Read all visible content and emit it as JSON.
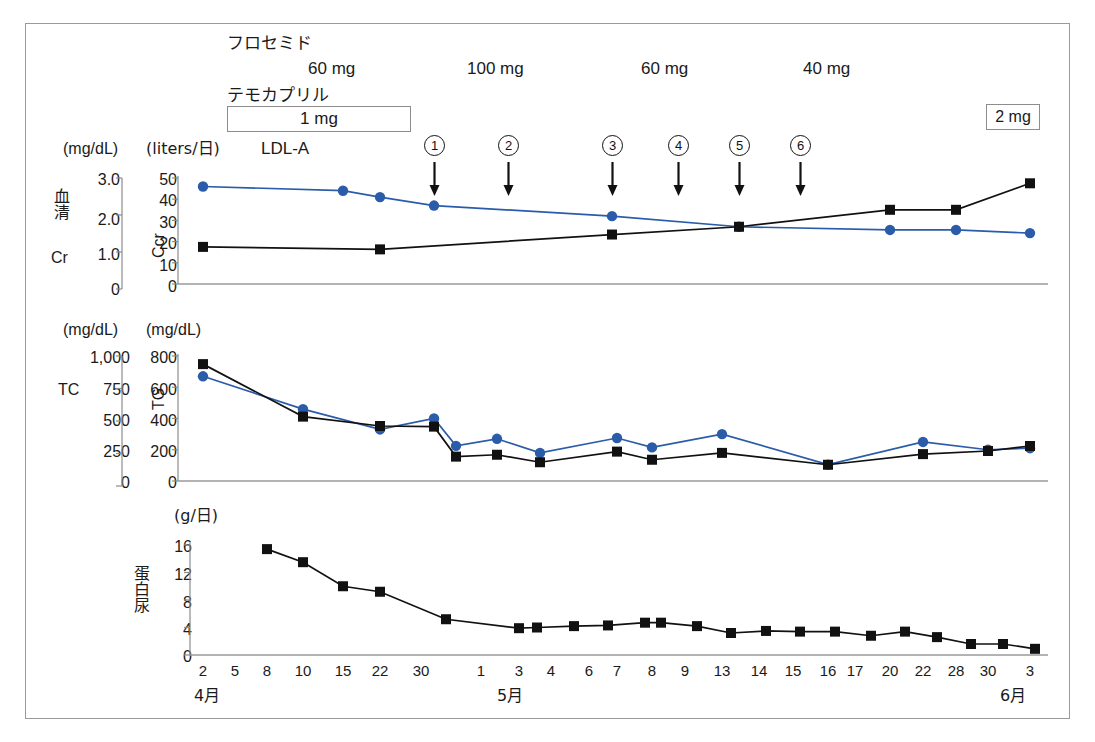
{
  "figure": {
    "title_absent": true,
    "border_color": "#9a9a9a",
    "series_colors": {
      "blue": "#2a5caa",
      "black": "#111111",
      "axis": "#8c8c8c"
    }
  },
  "treatment_header": {
    "drug1_name": "フロセミド",
    "drug1_doses": [
      {
        "label": "60 mg",
        "x": 310
      },
      {
        "label": "100 mg",
        "x": 470
      },
      {
        "label": "60 mg",
        "x": 645
      },
      {
        "label": "40 mg",
        "x": 805
      }
    ],
    "drug2_name": "テモカプリル",
    "drug2_dose_box": "1 mg",
    "drug2_dose_box2": "2 mg",
    "apheresis_label": "LDL-A",
    "session_markers": [
      {
        "label": "1",
        "x": 434
      },
      {
        "label": "2",
        "x": 508
      },
      {
        "label": "3",
        "x": 612
      },
      {
        "label": "4",
        "x": 678
      },
      {
        "label": "5",
        "x": 739
      },
      {
        "label": "6",
        "x": 800
      }
    ]
  },
  "panel1": {
    "left_axis": {
      "name": "血清Cr",
      "name_chars": [
        "血",
        "清",
        "Cr"
      ],
      "unit": "(mg/dL)",
      "ticks": [
        "3.0",
        "2.0",
        "1.0",
        "0"
      ],
      "min": 0,
      "max": 3.0
    },
    "right_axis": {
      "name": "Ccr",
      "unit": "(liters/日)",
      "ticks": [
        "50",
        "40",
        "30",
        "20",
        "10",
        "0"
      ],
      "min": 0,
      "max": 50
    }
  },
  "panel2": {
    "left_axis": {
      "name": "TC",
      "unit": "(mg/dL)",
      "ticks": [
        "1,000",
        "750",
        "500",
        "250",
        "0"
      ],
      "min": 0,
      "max": 1000
    },
    "right_axis": {
      "name": "TG",
      "unit": "(mg/dL)",
      "ticks": [
        "800",
        "600",
        "400",
        "200",
        "0"
      ],
      "min": 0,
      "max": 800
    }
  },
  "panel3": {
    "axis": {
      "name": "蛋白尿",
      "name_chars": [
        "蛋",
        "白",
        "尿"
      ],
      "unit": "(g/日)",
      "ticks": [
        "16",
        "12",
        "8",
        "4",
        "0"
      ],
      "min": 0,
      "max": 16
    }
  },
  "xaxis": {
    "month_labels": [
      {
        "label": "4月",
        "x": 205
      },
      {
        "label": "5月",
        "x": 510
      },
      {
        "label": "6月",
        "x": 1012
      }
    ],
    "ticks": [
      {
        "day": "2",
        "x": 203
      },
      {
        "day": "5",
        "x": 235
      },
      {
        "day": "8",
        "x": 267
      },
      {
        "day": "10",
        "x": 303
      },
      {
        "day": "15",
        "x": 343
      },
      {
        "day": "22",
        "x": 380
      },
      {
        "day": "30",
        "x": 421
      },
      {
        "day": "1",
        "x": 481
      },
      {
        "day": "3",
        "x": 519
      },
      {
        "day": "4",
        "x": 551
      },
      {
        "day": "6",
        "x": 589
      },
      {
        "day": "7",
        "x": 617
      },
      {
        "day": "8",
        "x": 652
      },
      {
        "day": "9",
        "x": 685
      },
      {
        "day": "13",
        "x": 722
      },
      {
        "day": "14",
        "x": 759
      },
      {
        "day": "15",
        "x": 793
      },
      {
        "day": "16",
        "x": 828
      },
      {
        "day": "17",
        "x": 855
      },
      {
        "day": "20",
        "x": 890
      },
      {
        "day": "22",
        "x": 923
      },
      {
        "day": "28",
        "x": 956
      },
      {
        "day": "30",
        "x": 988
      },
      {
        "day": "3",
        "x": 1030
      }
    ]
  },
  "chart_data": [
    {
      "type": "line",
      "title": "血清Cr / Ccr",
      "xlabel": "",
      "ylabel": "Ccr (liters/日)",
      "y2label": "血清Cr (mg/dL)",
      "ylim": [
        0,
        50
      ],
      "y2lim": [
        0,
        3.0
      ],
      "grid": false,
      "series": [
        {
          "name": "Ccr",
          "color": "#2a5caa",
          "marker": "circle",
          "unit": "liters/日",
          "points": [
            {
              "date": "4/2",
              "x": 203,
              "value": 46
            },
            {
              "date": "4/15",
              "x": 343,
              "value": 44
            },
            {
              "date": "4/22",
              "x": 380,
              "value": 41
            },
            {
              "date": "4/30",
              "x": 434,
              "value": 37
            },
            {
              "date": "5/7",
              "x": 612,
              "value": 32
            },
            {
              "date": "5/14",
              "x": 739,
              "value": 27
            },
            {
              "date": "5/22",
              "x": 890,
              "value": 25.5
            },
            {
              "date": "5/28",
              "x": 956,
              "value": 25.5
            },
            {
              "date": "6/3",
              "x": 1030,
              "value": 24
            }
          ]
        },
        {
          "name": "血清Cr",
          "color": "#111111",
          "marker": "square",
          "unit": "mg/dL",
          "points": [
            {
              "date": "4/2",
              "x": 203,
              "value": 1.05
            },
            {
              "date": "4/22",
              "x": 380,
              "value": 0.98
            },
            {
              "date": "5/7",
              "x": 612,
              "value": 1.4
            },
            {
              "date": "5/14",
              "x": 739,
              "value": 1.62
            },
            {
              "date": "5/22",
              "x": 890,
              "value": 2.1
            },
            {
              "date": "5/28",
              "x": 956,
              "value": 2.1
            },
            {
              "date": "6/3",
              "x": 1030,
              "value": 2.85
            }
          ]
        }
      ]
    },
    {
      "type": "line",
      "title": "TC / TG",
      "xlabel": "",
      "ylabel": "TG (mg/dL)",
      "y2label": "TC (mg/dL)",
      "ylim": [
        0,
        800
      ],
      "y2lim": [
        0,
        1000
      ],
      "grid": false,
      "series": [
        {
          "name": "TG",
          "color": "#2a5caa",
          "marker": "circle",
          "unit": "mg/dL",
          "points": [
            {
              "date": "4/2",
              "x": 203,
              "value": 670
            },
            {
              "date": "4/10",
              "x": 303,
              "value": 460
            },
            {
              "date": "4/22",
              "x": 380,
              "value": 330
            },
            {
              "date": "4/30",
              "x": 434,
              "value": 400
            },
            {
              "date": "5/1",
              "x": 456,
              "value": 225
            },
            {
              "date": "5/3",
              "x": 497,
              "value": 270
            },
            {
              "date": "5/4",
              "x": 540,
              "value": 180
            },
            {
              "date": "5/7",
              "x": 617,
              "value": 275
            },
            {
              "date": "5/8",
              "x": 652,
              "value": 215
            },
            {
              "date": "5/13",
              "x": 722,
              "value": 300
            },
            {
              "date": "5/16",
              "x": 828,
              "value": 105
            },
            {
              "date": "5/22",
              "x": 923,
              "value": 250
            },
            {
              "date": "5/30",
              "x": 988,
              "value": 200
            },
            {
              "date": "6/3",
              "x": 1030,
              "value": 210
            }
          ]
        },
        {
          "name": "TC",
          "color": "#111111",
          "marker": "square",
          "unit": "mg/dL",
          "points": [
            {
              "date": "4/2",
              "x": 203,
              "value": 935
            },
            {
              "date": "4/10",
              "x": 303,
              "value": 515
            },
            {
              "date": "4/22",
              "x": 380,
              "value": 440
            },
            {
              "date": "4/30",
              "x": 434,
              "value": 435
            },
            {
              "date": "5/1",
              "x": 456,
              "value": 195
            },
            {
              "date": "5/3",
              "x": 497,
              "value": 210
            },
            {
              "date": "5/4",
              "x": 540,
              "value": 150
            },
            {
              "date": "5/7",
              "x": 617,
              "value": 235
            },
            {
              "date": "5/8",
              "x": 652,
              "value": 170
            },
            {
              "date": "5/13",
              "x": 722,
              "value": 225
            },
            {
              "date": "5/16",
              "x": 828,
              "value": 130
            },
            {
              "date": "5/22",
              "x": 923,
              "value": 215
            },
            {
              "date": "5/30",
              "x": 988,
              "value": 240
            },
            {
              "date": "6/3",
              "x": 1030,
              "value": 280
            }
          ]
        }
      ]
    },
    {
      "type": "line",
      "title": "蛋白尿",
      "xlabel": "",
      "ylabel": "蛋白尿 (g/日)",
      "ylim": [
        0,
        16
      ],
      "grid": false,
      "series": [
        {
          "name": "蛋白尿",
          "color": "#111111",
          "marker": "square",
          "unit": "g/日",
          "points": [
            {
              "date": "4/8",
              "x": 267,
              "value": 15.4
            },
            {
              "date": "4/10",
              "x": 303,
              "value": 13.5
            },
            {
              "date": "4/15",
              "x": 343,
              "value": 10.0
            },
            {
              "date": "4/22",
              "x": 380,
              "value": 9.2
            },
            {
              "date": "4/30",
              "x": 446,
              "value": 5.2
            },
            {
              "date": "5/1",
              "x": 519,
              "value": 3.9
            },
            {
              "date": "5/3",
              "x": 537,
              "value": 4.0
            },
            {
              "date": "5/4",
              "x": 574,
              "value": 4.2
            },
            {
              "date": "5/6",
              "x": 608,
              "value": 4.3
            },
            {
              "date": "5/7",
              "x": 645,
              "value": 4.7
            },
            {
              "date": "5/8",
              "x": 661,
              "value": 4.7
            },
            {
              "date": "5/9",
              "x": 697,
              "value": 4.2
            },
            {
              "date": "5/13",
              "x": 731,
              "value": 3.2
            },
            {
              "date": "5/14",
              "x": 766,
              "value": 3.5
            },
            {
              "date": "5/15",
              "x": 800,
              "value": 3.4
            },
            {
              "date": "5/16",
              "x": 835,
              "value": 3.4
            },
            {
              "date": "5/17",
              "x": 871,
              "value": 2.8
            },
            {
              "date": "5/20",
              "x": 905,
              "value": 3.4
            },
            {
              "date": "5/22",
              "x": 937,
              "value": 2.6
            },
            {
              "date": "5/28",
              "x": 971,
              "value": 1.6
            },
            {
              "date": "5/30",
              "x": 1003,
              "value": 1.6
            },
            {
              "date": "6/3",
              "x": 1035,
              "value": 0.9
            }
          ]
        }
      ]
    }
  ]
}
